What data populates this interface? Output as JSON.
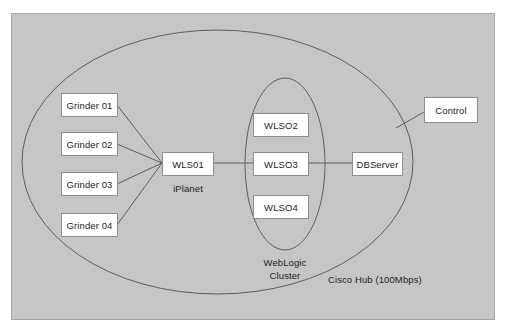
{
  "diagram": {
    "panel": {
      "background_color": "#c6c6c6",
      "border_color": "#a6a6a6"
    },
    "colors": {
      "node_fill": "#ffffff",
      "node_border": "#8d8d8d",
      "line": "#5d5d5d",
      "text": "#1d1d1d"
    },
    "groups": [
      {
        "id": "cisco-hub",
        "caption": "Cisco Hub (100Mbps)",
        "shape": "ellipse"
      },
      {
        "id": "weblogic-cluster",
        "caption_line1": "WebLogic",
        "caption_line2": "Cluster",
        "shape": "ellipse"
      }
    ],
    "nodes": [
      {
        "id": "grinder01",
        "label": "Grinder 01"
      },
      {
        "id": "grinder02",
        "label": "Grinder 02"
      },
      {
        "id": "grinder03",
        "label": "Grinder 03"
      },
      {
        "id": "grinder04",
        "label": "Grinder 04"
      },
      {
        "id": "wls01",
        "label": "WLS01",
        "sublabel": "iPlanet"
      },
      {
        "id": "wls02",
        "label": "WLSO2"
      },
      {
        "id": "wls03",
        "label": "WLSO3"
      },
      {
        "id": "wls04",
        "label": "WLSO4"
      },
      {
        "id": "dbserver",
        "label": "DBServer"
      },
      {
        "id": "control",
        "label": "Control"
      }
    ],
    "connections": [
      {
        "from": "grinder01",
        "to": "wls01"
      },
      {
        "from": "grinder02",
        "to": "wls01"
      },
      {
        "from": "grinder03",
        "to": "wls01"
      },
      {
        "from": "grinder04",
        "to": "wls01"
      },
      {
        "from": "wls01",
        "to": "weblogic-cluster"
      },
      {
        "from": "weblogic-cluster",
        "to": "dbserver"
      },
      {
        "from": "control",
        "to": "cisco-hub"
      }
    ]
  }
}
